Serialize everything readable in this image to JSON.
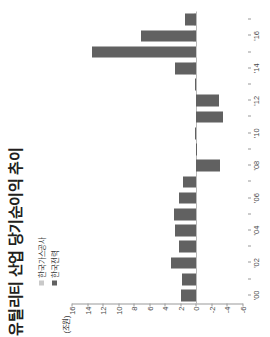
{
  "title": "유틸리티 산업 당기순이익 추이",
  "unit_label": "(조원)",
  "legend": {
    "items": [
      {
        "label": "한국가스공사",
        "color": "#c9c9c9",
        "key": "kogas"
      },
      {
        "label": "한국전력",
        "color": "#616161",
        "key": "kepco"
      }
    ]
  },
  "colors": {
    "kepco": "#616161",
    "kogas": "#c9c9c9",
    "axis": "#9a9a9a",
    "zero_line": "#b9b9b9",
    "text": "#3a3a3a",
    "title": "#231f20",
    "background": "#ffffff"
  },
  "chart_data": {
    "type": "bar",
    "orientation": "vertical-rotated",
    "title": "유틸리티 산업 당기순이익 추이",
    "xlabel": "",
    "ylabel": "(조원)",
    "ylim": [
      -6,
      16
    ],
    "ytick_values": [
      16,
      14,
      12,
      10,
      8,
      6,
      4,
      2,
      0,
      -2,
      -4,
      -6
    ],
    "ytick_labels": [
      "16",
      "14",
      "12",
      "10",
      "8",
      "6",
      "4",
      "2",
      "0",
      "-2",
      "-4",
      "-6"
    ],
    "grid": false,
    "legend_position": "top-left",
    "categories": [
      "'00",
      "'01",
      "'02",
      "'03",
      "'04",
      "'05",
      "'06",
      "'07",
      "'08",
      "'09",
      "'10",
      "'11",
      "'12",
      "'13",
      "'14",
      "'15",
      "'16",
      "'17"
    ],
    "xtick_labels": [
      "'00",
      "'02",
      "'04",
      "'06",
      "'08",
      "'10",
      "'12",
      "'14",
      "'16"
    ],
    "series": [
      {
        "name": "한국전력",
        "key": "kepco",
        "color": "#616161",
        "values": [
          2.0,
          1.8,
          3.2,
          2.2,
          2.8,
          2.9,
          2.2,
          1.7,
          -3.0,
          0.1,
          0.2,
          -3.4,
          -2.9,
          0.2,
          2.8,
          13.4,
          7.1,
          1.5
        ]
      },
      {
        "name": "한국가스공사",
        "key": "kogas",
        "color": "#c9c9c9",
        "values": [
          0.0,
          0.0,
          0.0,
          0.0,
          0.0,
          0.0,
          0.0,
          0.0,
          0.0,
          0.0,
          0.0,
          0.0,
          0.0,
          0.0,
          0.45,
          0.1,
          0.4,
          0.3
        ]
      }
    ]
  }
}
